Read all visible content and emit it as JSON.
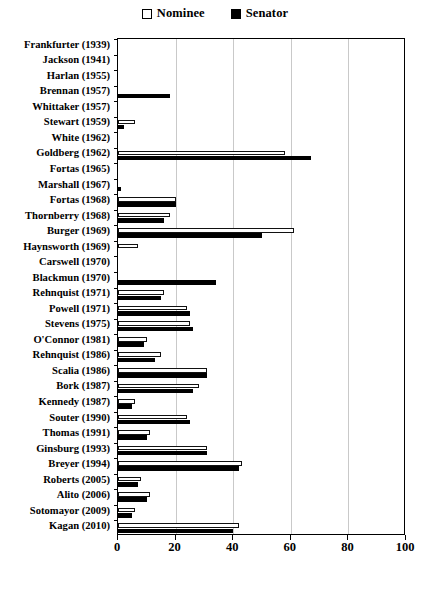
{
  "legend": {
    "items": [
      {
        "label": "Nominee",
        "swatch": "open-square-icon",
        "color": "#ffffff"
      },
      {
        "label": "Senator",
        "swatch": "filled-square-icon",
        "color": "#000000"
      }
    ]
  },
  "axis": {
    "x_ticks": [
      0,
      20,
      40,
      60,
      80,
      100
    ],
    "x_tick_labels": [
      "0",
      "20",
      "40",
      "60",
      "80",
      "100"
    ],
    "xlim": [
      0,
      100
    ],
    "gridlines": [
      20,
      40,
      60,
      80
    ]
  },
  "chart_data": {
    "type": "bar",
    "orientation": "horizontal",
    "title": "",
    "subtitle": "",
    "xlabel": "",
    "ylabel": "",
    "xlim": [
      0,
      100
    ],
    "grid": true,
    "legend_position": "top-center",
    "categories": [
      "Frankfurter (1939)",
      "Jackson (1941)",
      "Harlan (1955)",
      "Brennan (1957)",
      "Whittaker (1957)",
      "Stewart (1959)",
      "White (1962)",
      "Goldberg (1962)",
      "Fortas (1965)",
      "Marshall (1967)",
      "Fortas (1968)",
      "Thornberry (1968)",
      "Burger (1969)",
      "Haynsworth (1969)",
      "Carswell (1970)",
      "Blackmun (1970)",
      "Rehnquist (1971)",
      "Powell (1971)",
      "Stevens (1975)",
      "O'Connor (1981)",
      "Rehnquist (1986)",
      "Scalia (1986)",
      "Bork (1987)",
      "Kennedy (1987)",
      "Souter (1990)",
      "Thomas (1991)",
      "Ginsburg (1993)",
      "Breyer (1994)",
      "Roberts (2005)",
      "Alito (2006)",
      "Sotomayor (2009)",
      "Kagan (2010)"
    ],
    "series": [
      {
        "name": "Nominee",
        "color": "#ffffff",
        "values": [
          0,
          0,
          0,
          0,
          0,
          6,
          0,
          58,
          0,
          0,
          20,
          18,
          61,
          7,
          0,
          0,
          16,
          24,
          25,
          10,
          15,
          31,
          28,
          6,
          24,
          11,
          31,
          43,
          8,
          11,
          6,
          42
        ]
      },
      {
        "name": "Senator",
        "color": "#000000",
        "values": [
          0,
          0,
          0,
          18,
          0,
          2,
          0,
          67,
          0,
          1,
          20,
          16,
          50,
          0,
          0,
          34,
          15,
          25,
          26,
          9,
          13,
          31,
          26,
          5,
          25,
          10,
          31,
          42,
          7,
          10,
          5,
          40
        ]
      }
    ]
  }
}
